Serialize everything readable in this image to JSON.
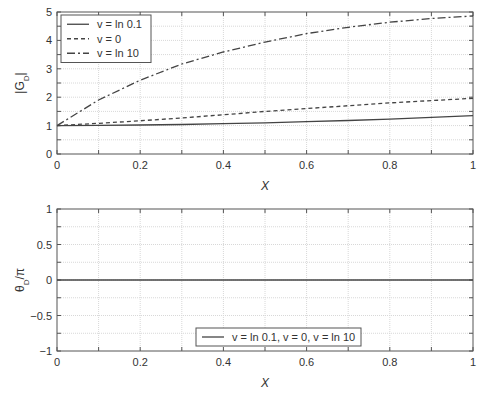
{
  "chart_data": [
    {
      "type": "line",
      "title": "",
      "xlabel": "X",
      "ylabel": "|G_D|",
      "xlim": [
        0,
        1
      ],
      "ylim": [
        0,
        5
      ],
      "grid": true,
      "legend_position": "upper left",
      "xticks": [
        "0",
        "0.2",
        "0.4",
        "0.6",
        "0.8",
        "1"
      ],
      "yticks": [
        "0",
        "1",
        "2",
        "3",
        "4",
        "5"
      ],
      "x": [
        0,
        0.1,
        0.2,
        0.3,
        0.4,
        0.5,
        0.6,
        0.7,
        0.8,
        0.9,
        1.0
      ],
      "series": [
        {
          "name": "v = ln 0.1",
          "style": "solid",
          "values": [
            1.0,
            1.01,
            1.02,
            1.04,
            1.07,
            1.1,
            1.14,
            1.18,
            1.23,
            1.29,
            1.35
          ]
        },
        {
          "name": "v = 0",
          "style": "dashed",
          "values": [
            1.0,
            1.08,
            1.17,
            1.27,
            1.38,
            1.5,
            1.6,
            1.7,
            1.8,
            1.88,
            1.96
          ]
        },
        {
          "name": "v = ln 10",
          "style": "dashdot",
          "values": [
            1.0,
            1.9,
            2.6,
            3.17,
            3.59,
            3.94,
            4.24,
            4.46,
            4.64,
            4.77,
            4.86
          ]
        }
      ]
    },
    {
      "type": "line",
      "title": "",
      "xlabel": "X",
      "ylabel": "θ_D/π",
      "xlim": [
        0,
        1
      ],
      "ylim": [
        -1,
        1
      ],
      "grid": true,
      "legend_position": "lower center",
      "xticks": [
        "0",
        "0.2",
        "0.4",
        "0.6",
        "0.8",
        "1"
      ],
      "yticks": [
        "−1",
        "−0.5",
        "0",
        "0.5",
        "1"
      ],
      "x": [
        0,
        1
      ],
      "series": [
        {
          "name": "v = ln 0.1, v = 0, v = ln 10",
          "style": "solid",
          "values": [
            0,
            0
          ]
        }
      ]
    }
  ],
  "top_plot": {
    "xlabel": "X",
    "ylabel_main": "|G",
    "ylabel_sub": "D",
    "ylabel_end": "|",
    "legend": [
      "v = ln 0.1",
      "v = 0",
      "v = ln 10"
    ]
  },
  "bottom_plot": {
    "xlabel": "X",
    "ylabel_main": "θ",
    "ylabel_sub": "D",
    "ylabel_end": "/π",
    "legend": [
      "v = ln 0.1, v = 0, v = ln 10"
    ]
  },
  "colors": {
    "axis": "#555555",
    "grid": "#d8d8d8",
    "line": "#444444"
  }
}
